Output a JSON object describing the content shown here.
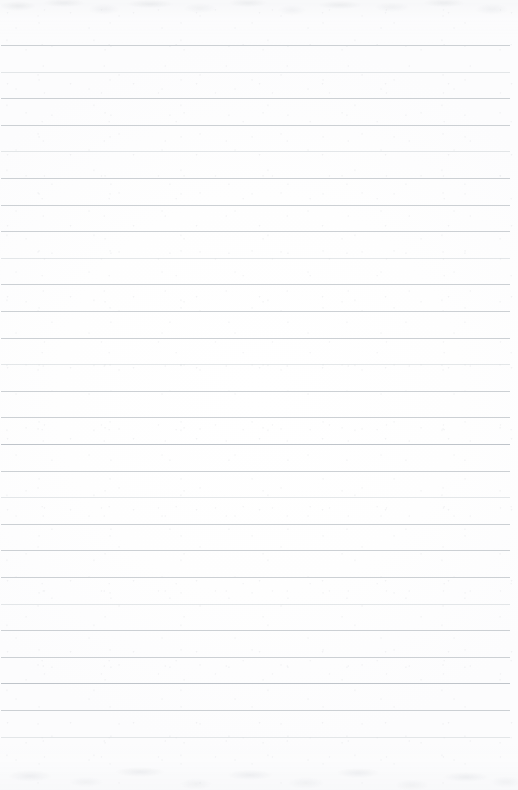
{
  "document": {
    "kind": "lined-notebook-paper",
    "title": "Blank ruled paper sheet",
    "page_width": 518,
    "page_height": 790,
    "content_text": "",
    "has_written_content": false
  },
  "paper": {
    "background_color": "#fdfdfd",
    "paper_tint_color": "#ffffff",
    "edge_shade_color": "#f6f7f8",
    "texture_description": "faint gray mottled grain along top and bottom edges",
    "texture_color": "#a0a6ad"
  },
  "ruling": {
    "line_color": "#c9cdd2",
    "line_color_faint": "#d4d8dc",
    "line_color_strong": "#bfc4ca",
    "line_thickness_px": 1,
    "line_count": 27,
    "first_line_y": 45,
    "line_spacing_px": 26.6,
    "line_start_x": 1,
    "line_end_x": 510,
    "margin_rule": "none",
    "lines": [
      {
        "index": 1,
        "y": 45,
        "weight": "normal"
      },
      {
        "index": 2,
        "y": 72,
        "weight": "faint"
      },
      {
        "index": 3,
        "y": 98,
        "weight": "normal"
      },
      {
        "index": 4,
        "y": 125,
        "weight": "normal"
      },
      {
        "index": 5,
        "y": 151,
        "weight": "faint"
      },
      {
        "index": 6,
        "y": 178,
        "weight": "normal"
      },
      {
        "index": 7,
        "y": 205,
        "weight": "normal"
      },
      {
        "index": 8,
        "y": 231,
        "weight": "normal"
      },
      {
        "index": 9,
        "y": 258,
        "weight": "faint"
      },
      {
        "index": 10,
        "y": 284,
        "weight": "normal"
      },
      {
        "index": 11,
        "y": 311,
        "weight": "normal"
      },
      {
        "index": 12,
        "y": 338,
        "weight": "normal"
      },
      {
        "index": 13,
        "y": 364,
        "weight": "faint"
      },
      {
        "index": 14,
        "y": 391,
        "weight": "normal"
      },
      {
        "index": 15,
        "y": 417,
        "weight": "normal"
      },
      {
        "index": 16,
        "y": 444,
        "weight": "strong"
      },
      {
        "index": 17,
        "y": 471,
        "weight": "normal"
      },
      {
        "index": 18,
        "y": 497,
        "weight": "faint"
      },
      {
        "index": 19,
        "y": 524,
        "weight": "normal"
      },
      {
        "index": 20,
        "y": 550,
        "weight": "normal"
      },
      {
        "index": 21,
        "y": 577,
        "weight": "normal"
      },
      {
        "index": 22,
        "y": 604,
        "weight": "faint"
      },
      {
        "index": 23,
        "y": 630,
        "weight": "normal"
      },
      {
        "index": 24,
        "y": 657,
        "weight": "normal"
      },
      {
        "index": 25,
        "y": 683,
        "weight": "strong"
      },
      {
        "index": 26,
        "y": 710,
        "weight": "normal"
      },
      {
        "index": 27,
        "y": 737,
        "weight": "faint"
      }
    ]
  }
}
